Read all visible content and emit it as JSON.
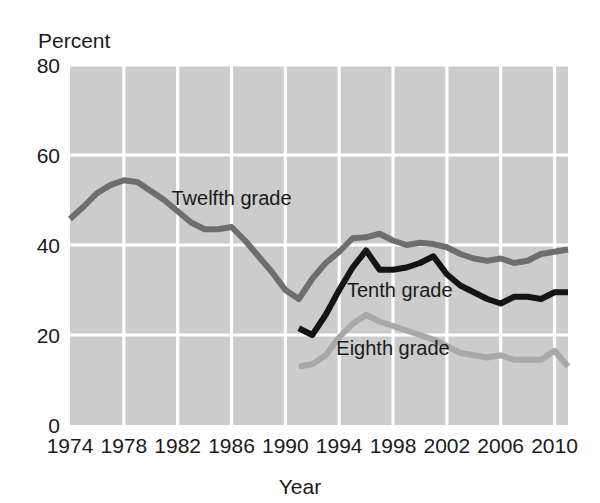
{
  "chart_data": {
    "type": "line",
    "title": "",
    "subtitle": "",
    "xlabel": "Year",
    "ylabel": "Percent",
    "xlim": [
      1974,
      2011
    ],
    "ylim": [
      0,
      80
    ],
    "grid": true,
    "legend_position": "inline-annotations",
    "y_ticks": [
      0,
      20,
      40,
      60,
      80
    ],
    "y_tick_labels": [
      "0",
      "20",
      "40",
      "60",
      "80"
    ],
    "x_ticks": [
      1974,
      1978,
      1982,
      1986,
      1990,
      1994,
      1998,
      2002,
      2006,
      2010
    ],
    "x_tick_labels": [
      "1974",
      "1978",
      "1982",
      "1986",
      "1990",
      "1994",
      "1998",
      "2002",
      "2006",
      "2010"
    ],
    "series": [
      {
        "name": "Twelfth grade",
        "color": "#6e6e6e",
        "label_x": 1986.0,
        "label_y": 49.0,
        "x": [
          1974,
          1975,
          1976,
          1977,
          1978,
          1979,
          1980,
          1981,
          1982,
          1983,
          1984,
          1985,
          1986,
          1987,
          1988,
          1989,
          1990,
          1991,
          1992,
          1993,
          1994,
          1995,
          1996,
          1997,
          1998,
          1999,
          2000,
          2001,
          2002,
          2003,
          2004,
          2005,
          2006,
          2007,
          2008,
          2009,
          2010,
          2011
        ],
        "values": [
          45.8,
          48.5,
          51.5,
          53.3,
          54.4,
          54.0,
          52.0,
          50.0,
          47.5,
          45.0,
          43.5,
          43.5,
          44.0,
          41.0,
          37.5,
          34.0,
          30.0,
          28.0,
          32.5,
          36.0,
          38.5,
          41.5,
          41.7,
          42.5,
          41.0,
          40.0,
          40.5,
          40.2,
          39.5,
          38.0,
          37.0,
          36.5,
          37.0,
          36.0,
          36.5,
          38.0,
          38.5,
          39.0
        ]
      },
      {
        "name": "Tenth grade",
        "color": "#141414",
        "label_x": 1998.5,
        "label_y": 28.5,
        "x": [
          1991,
          1992,
          1993,
          1994,
          1995,
          1996,
          1997,
          1998,
          1999,
          2000,
          2001,
          2002,
          2003,
          2004,
          2005,
          2006,
          2007,
          2008,
          2009,
          2010,
          2011
        ],
        "values": [
          21.5,
          20.0,
          24.5,
          30.0,
          35.0,
          38.8,
          34.5,
          34.5,
          35.0,
          36.0,
          37.5,
          33.5,
          31.0,
          29.5,
          28.0,
          27.0,
          28.5,
          28.5,
          28.0,
          29.5,
          29.5
        ]
      },
      {
        "name": "Eighth grade",
        "color": "#a8a8a8",
        "label_x": 1998.0,
        "label_y": 15.5,
        "x": [
          1991,
          1992,
          1993,
          1994,
          1995,
          1996,
          1997,
          1998,
          1999,
          2000,
          2001,
          2002,
          2003,
          2004,
          2005,
          2006,
          2007,
          2008,
          2009,
          2010,
          2011
        ],
        "values": [
          13.0,
          13.5,
          15.5,
          19.5,
          22.5,
          24.5,
          23.0,
          22.0,
          21.0,
          20.0,
          19.0,
          17.5,
          16.0,
          15.5,
          15.0,
          15.5,
          14.5,
          14.5,
          14.5,
          16.5,
          13.0
        ]
      }
    ]
  },
  "labels": {
    "y_axis_title": "Percent",
    "x_axis_title": "Year"
  }
}
